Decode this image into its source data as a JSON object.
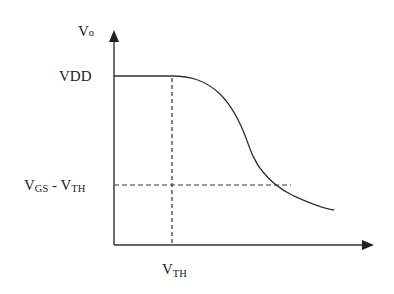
{
  "diagram": {
    "type": "transfer-characteristic",
    "colors": {
      "stroke": "#333333",
      "text": "#222222",
      "background": "#ffffff"
    },
    "y_axis": {
      "label_main": "V",
      "label_sub": "o"
    },
    "x_axis": {
      "label": ""
    },
    "y_ticks": [
      {
        "label_main": "VDD",
        "label_sub": ""
      },
      {
        "label_main": "V",
        "label_sub": "GS",
        "label_mid": " - V",
        "label_sub2": "TH"
      }
    ],
    "x_ticks": [
      {
        "label_main": "V",
        "label_sub": "TH"
      }
    ],
    "curve": {
      "description": "Output voltage stays at VDD until VTH, then falls in an S-shaped curve, crossing VGS - VTH and flattening toward the right",
      "points": [
        [
          172,
          76
        ],
        [
          200,
          82
        ],
        [
          220,
          95
        ],
        [
          236,
          115
        ],
        [
          245,
          135
        ],
        [
          252,
          155
        ],
        [
          262,
          170
        ],
        [
          275,
          185
        ],
        [
          300,
          198
        ],
        [
          334,
          210
        ]
      ]
    }
  }
}
